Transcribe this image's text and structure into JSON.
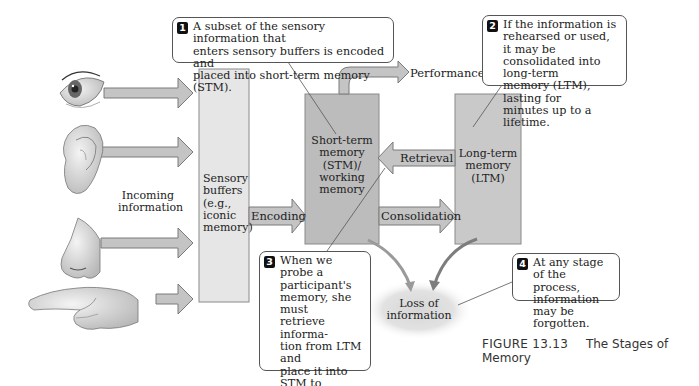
{
  "diagram": {
    "incoming_label": "Incoming information",
    "senses": [
      "eye",
      "ear",
      "nose",
      "hand"
    ],
    "sensory_buffers": {
      "label_lines": [
        "Sensory",
        "buffers",
        "(e.g.,",
        "iconic",
        "memory)"
      ]
    },
    "stm": {
      "label_lines": [
        "Short-term",
        "memory",
        "(STM)/",
        "working",
        "memory"
      ]
    },
    "ltm": {
      "label_lines": [
        "Long-term",
        "memory",
        "(LTM)"
      ]
    },
    "arrows": {
      "encoding": "Encoding",
      "consolidation": "Consolidation",
      "retrieval": "Retrieval",
      "performance": "Performance"
    },
    "loss": {
      "label_lines": [
        "Loss of",
        "information"
      ]
    },
    "callouts": [
      {
        "number": "1",
        "lines": [
          "A subset of the sensory information that",
          "enters sensory buffers is encoded and",
          "placed into short-term memory (STM)."
        ]
      },
      {
        "number": "2",
        "lines": [
          "If the information is",
          "rehearsed or used, it may be",
          "consolidated into long-term",
          "memory (LTM), lasting for",
          "minutes up to a lifetime."
        ]
      },
      {
        "number": "3",
        "lines": [
          "When we probe a",
          "participant's",
          "memory, she must",
          "retrieve informa-",
          "tion from LTM and",
          "place it into STM to",
          "perform a task, such",
          "as reporting the",
          "items in a list."
        ]
      },
      {
        "number": "4",
        "lines": [
          "At any stage of the",
          "process, information",
          "may be forgotten."
        ]
      }
    ],
    "colors": {
      "box_light": "#e3e3e3",
      "box_dark": "#bdbdbd",
      "arrow_fill": "#c4c4c4",
      "outline": "#7a7a7a",
      "badge": "#111111"
    }
  },
  "caption": {
    "figure": "FIGURE 13.13",
    "title": "The Stages of Memory"
  }
}
